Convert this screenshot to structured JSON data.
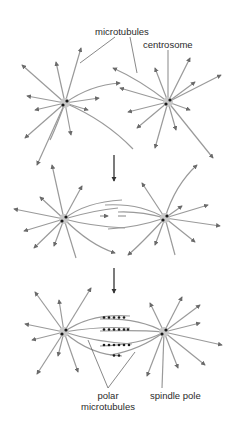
{
  "diagram": {
    "colors": {
      "background": "#ffffff",
      "microtubule": "#9a9a9a",
      "centrosome_halo": "#c8c8c8",
      "centriole": "#1a1a1a",
      "arrow": "#333333",
      "label_line": "#555555",
      "text": "#2a2a2a"
    },
    "panels": [
      {
        "id": "stage-1",
        "description": "two separate asters of microtubules radiating from centrosomes"
      },
      {
        "id": "stage-2",
        "description": "centrosomes separate; overlapping microtubules between poles"
      },
      {
        "id": "stage-3",
        "description": "bipolar spindle with polar microtubules cross-linked by motor proteins"
      }
    ],
    "labels": {
      "microtubules": "microtubules",
      "centrosome": "centrosome",
      "polar_line1": "polar",
      "polar_line2": "microtubules",
      "spindle_pole": "spindle pole"
    },
    "step_arrows": 2
  }
}
